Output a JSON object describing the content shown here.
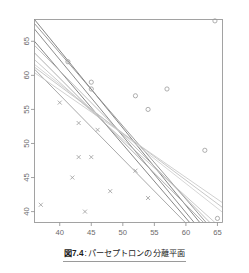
{
  "figure": {
    "caption_number": "図7.4",
    "caption_separator": ":",
    "caption_text": "パーセプトロンの分離平面"
  },
  "chart_data": {
    "type": "scatter",
    "title": "",
    "xlabel": "",
    "ylabel": "",
    "xlim": [
      36.0,
      65.8
    ],
    "ylim": [
      38.4,
      68.2
    ],
    "xticks": [
      40,
      45,
      50,
      55,
      60,
      65
    ],
    "yticks": [
      40,
      45,
      50,
      55,
      60,
      65
    ],
    "xtick_labels": [
      "40",
      "45",
      "50",
      "55",
      "60",
      "65"
    ],
    "ytick_labels": [
      "40",
      "45",
      "50",
      "55",
      "60",
      "65"
    ],
    "ytick_label_rotation": 90,
    "grid": false,
    "legend": false,
    "frame_color": "#8c8c8c",
    "series": [
      {
        "name": "class-circle",
        "marker": "circle",
        "color": "#9a9a9a",
        "points": [
          [
            64.6,
            68.0
          ],
          [
            57.0,
            58.0
          ],
          [
            54.0,
            55.0
          ],
          [
            52.0,
            57.0
          ],
          [
            63.0,
            49.0
          ],
          [
            65.0,
            39.0
          ],
          [
            45.0,
            59.0
          ],
          [
            45.0,
            58.0
          ],
          [
            41.3,
            62.0
          ]
        ]
      },
      {
        "name": "class-cross",
        "marker": "cross",
        "color": "#9a9a9a",
        "points": [
          [
            40.0,
            56.0
          ],
          [
            43.0,
            53.0
          ],
          [
            46.0,
            52.0
          ],
          [
            43.0,
            48.0
          ],
          [
            45.0,
            48.0
          ],
          [
            42.0,
            45.0
          ],
          [
            48.0,
            43.0
          ],
          [
            54.0,
            42.0
          ],
          [
            52.0,
            46.0
          ],
          [
            37.0,
            41.0
          ],
          [
            44.0,
            40.0
          ]
        ]
      }
    ],
    "lines": {
      "name": "separating-hyperplanes",
      "count": 11,
      "color": "#a8a8a8",
      "description": "bundle of perceptron separating planes, negative slope",
      "segments": [
        {
          "x0": 36.0,
          "y0": 68.2,
          "x1": 62.2,
          "y1": 38.4,
          "shade": "#6f6f6f"
        },
        {
          "x0": 36.0,
          "y0": 67.6,
          "x1": 63.2,
          "y1": 38.4,
          "shade": "#8a8a8a"
        },
        {
          "x0": 36.0,
          "y0": 66.8,
          "x1": 61.3,
          "y1": 38.4,
          "shade": "#787878"
        },
        {
          "x0": 36.0,
          "y0": 65.0,
          "x1": 60.6,
          "y1": 38.4,
          "shade": "#707070"
        },
        {
          "x0": 36.0,
          "y0": 64.4,
          "x1": 63.8,
          "y1": 38.4,
          "shade": "#b2b2b2"
        },
        {
          "x0": 36.0,
          "y0": 63.3,
          "x1": 62.8,
          "y1": 38.4,
          "shade": "#a0a0a0"
        },
        {
          "x0": 36.0,
          "y0": 62.3,
          "x1": 64.6,
          "y1": 38.4,
          "shade": "#c0c0c0"
        },
        {
          "x0": 36.0,
          "y0": 61.6,
          "x1": 65.8,
          "y1": 39.9,
          "shade": "#cfcfcf"
        },
        {
          "x0": 36.0,
          "y0": 61.2,
          "x1": 65.8,
          "y1": 40.6,
          "shade": "#bdbdbd"
        },
        {
          "x0": 36.0,
          "y0": 60.9,
          "x1": 59.9,
          "y1": 38.4,
          "shade": "#9a9a9a"
        },
        {
          "x0": 36.0,
          "y0": 60.4,
          "x1": 65.8,
          "y1": 41.3,
          "shade": "#c8c8c8"
        }
      ]
    }
  }
}
